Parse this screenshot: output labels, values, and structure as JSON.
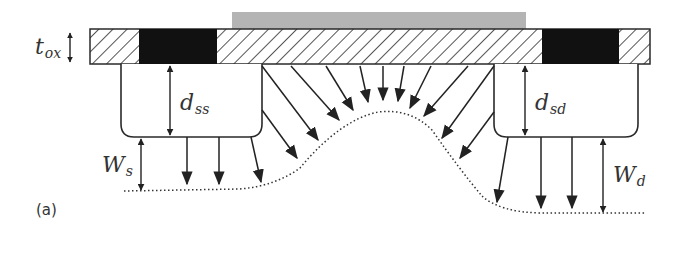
{
  "figure": {
    "caption": "(a)",
    "colors": {
      "gate": "#b4b4b4",
      "oxide_outline": "#2a2a2a",
      "contact_fill": "#111111",
      "line": "#2a2a2a"
    }
  },
  "labels": {
    "tox": {
      "main": "t",
      "sub": "ox"
    },
    "dss": {
      "main": "d",
      "sub": "ss"
    },
    "dsd": {
      "main": "d",
      "sub": "sd"
    },
    "ws": {
      "main": "W",
      "sub": "s"
    },
    "wd": {
      "main": "W",
      "sub": "d"
    }
  }
}
